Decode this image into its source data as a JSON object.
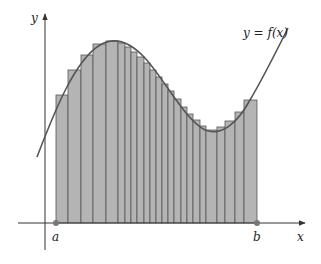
{
  "figure": {
    "curve_label": "y = f(x)",
    "x_axis_label": "x",
    "y_axis_label": "y",
    "point_a_label": "a",
    "point_b_label": "b"
  },
  "colors": {
    "rect_fill": "#b4b4b4",
    "rect_stroke": "#555555",
    "curve": "#555555",
    "axis": "#333333",
    "point": "#777777"
  },
  "rectangles": [
    {
      "x0": 56,
      "x1": 68,
      "top": 95
    },
    {
      "x0": 68,
      "x1": 81,
      "top": 70
    },
    {
      "x0": 81,
      "x1": 93,
      "top": 55
    },
    {
      "x0": 93,
      "x1": 106,
      "top": 44
    },
    {
      "x0": 106,
      "x1": 118,
      "top": 41
    },
    {
      "x0": 118,
      "x1": 125,
      "top": 43
    },
    {
      "x0": 125,
      "x1": 131,
      "top": 47
    },
    {
      "x0": 131,
      "x1": 137,
      "top": 52
    },
    {
      "x0": 137,
      "x1": 144,
      "top": 57
    },
    {
      "x0": 144,
      "x1": 150,
      "top": 63
    },
    {
      "x0": 150,
      "x1": 156,
      "top": 70
    },
    {
      "x0": 156,
      "x1": 162,
      "top": 77
    },
    {
      "x0": 162,
      "x1": 168,
      "top": 84
    },
    {
      "x0": 168,
      "x1": 174,
      "top": 91
    },
    {
      "x0": 174,
      "x1": 181,
      "top": 99
    },
    {
      "x0": 181,
      "x1": 187,
      "top": 107
    },
    {
      "x0": 187,
      "x1": 193,
      "top": 114
    },
    {
      "x0": 193,
      "x1": 200,
      "top": 120
    },
    {
      "x0": 200,
      "x1": 206,
      "top": 126
    },
    {
      "x0": 206,
      "x1": 217,
      "top": 130
    },
    {
      "x0": 217,
      "x1": 225,
      "top": 127
    },
    {
      "x0": 225,
      "x1": 235,
      "top": 121
    },
    {
      "x0": 235,
      "x1": 244,
      "top": 112
    },
    {
      "x0": 244,
      "x1": 257,
      "top": 100
    }
  ],
  "curve_path": "M37,157 C55,110 75,60 100,45 C115,36 130,42 145,58 C165,80 185,120 205,130 C222,137 238,122 250,100 C262,80 276,52 288,28",
  "axes": {
    "x_axis": {
      "x0": 18,
      "x1": 305,
      "y": 223
    },
    "y_axis": {
      "x": 45,
      "y0": 250,
      "y1": 14
    }
  },
  "points": {
    "a": {
      "x": 56,
      "y": 223
    },
    "b": {
      "x": 257,
      "y": 223
    }
  }
}
